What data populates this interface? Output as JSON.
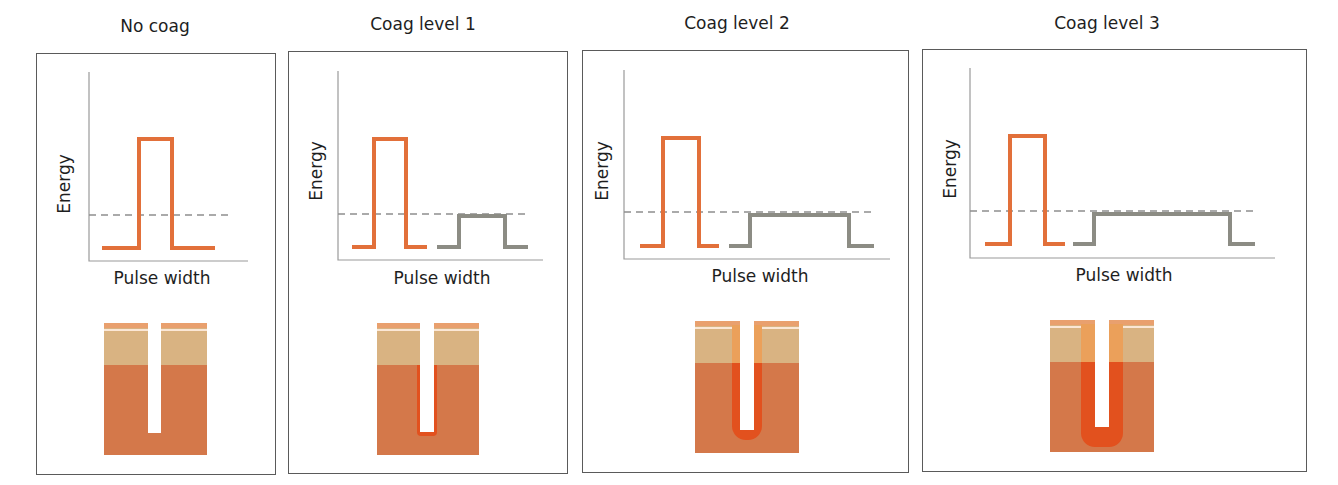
{
  "figure": {
    "panels": [
      {
        "title": "No coag",
        "xlabel": "Pulse width",
        "ylabel": "Energy",
        "box": {
          "x": 36,
          "y": 53,
          "w": 240,
          "h": 422
        },
        "title_pos": {
          "cx": 155,
          "y": 16
        },
        "axes": {
          "x0": 89,
          "y0": 72,
          "x1": 248,
          "ybase": 261
        },
        "threshold_y": 215,
        "threshold_x1": 231,
        "ablative_pulse": {
          "x_start": 102,
          "x_rise": 139,
          "x_fall": 172,
          "x_end": 215,
          "y_top": 139,
          "y_base": 248
        },
        "coag_pulse": null,
        "xlabel_pos": {
          "cx": 162,
          "y": 268
        },
        "ylabel_pos": {
          "cx": 64,
          "cy": 185
        },
        "tissue": {
          "x": 104,
          "y": 325,
          "w": 103,
          "h": 130,
          "channel_x": 148,
          "channel_w": 13,
          "channel_depth": 108,
          "coag_level": 0
        }
      },
      {
        "title": "Coag level 1",
        "xlabel": "Pulse width",
        "ylabel": "Energy",
        "box": {
          "x": 288,
          "y": 51,
          "w": 280,
          "h": 423
        },
        "title_pos": {
          "cx": 423,
          "y": 14
        },
        "axes": {
          "x0": 338,
          "y0": 71,
          "x1": 543,
          "ybase": 260
        },
        "threshold_y": 214,
        "threshold_x1": 530,
        "ablative_pulse": {
          "x_start": 352,
          "x_rise": 374,
          "x_fall": 406,
          "x_end": 427,
          "y_top": 139,
          "y_base": 247
        },
        "coag_pulse": {
          "x_start": 437,
          "x_rise": 459,
          "x_fall": 505,
          "x_end": 528,
          "y_top": 216,
          "y_base": 247
        },
        "xlabel_pos": {
          "cx": 442,
          "y": 268
        },
        "ylabel_pos": {
          "cx": 316,
          "cy": 172
        },
        "tissue": {
          "x": 377,
          "y": 325,
          "w": 102,
          "h": 130,
          "channel_x": 420,
          "channel_w": 14,
          "channel_depth": 107,
          "coag_level": 1
        }
      },
      {
        "title": "Coag level 2",
        "xlabel": "Pulse width",
        "ylabel": "Energy",
        "box": {
          "x": 582,
          "y": 50,
          "w": 327,
          "h": 423
        },
        "title_pos": {
          "cx": 737,
          "y": 13
        },
        "axes": {
          "x0": 624,
          "y0": 70,
          "x1": 890,
          "ybase": 259
        },
        "threshold_y": 212,
        "threshold_x1": 876,
        "ablative_pulse": {
          "x_start": 640,
          "x_rise": 663,
          "x_fall": 699,
          "x_end": 719,
          "y_top": 138,
          "y_base": 246
        },
        "coag_pulse": {
          "x_start": 729,
          "x_rise": 750,
          "x_fall": 849,
          "x_end": 874,
          "y_top": 215,
          "y_base": 246
        },
        "xlabel_pos": {
          "cx": 760,
          "y": 266
        },
        "ylabel_pos": {
          "cx": 602,
          "cy": 172
        },
        "tissue": {
          "x": 695,
          "y": 323,
          "w": 104,
          "h": 130,
          "channel_x": 740,
          "channel_w": 14,
          "channel_depth": 107,
          "coag_level": 2
        }
      },
      {
        "title": "Coag level 3",
        "xlabel": "Pulse width",
        "ylabel": "Energy",
        "box": {
          "x": 922,
          "y": 49,
          "w": 385,
          "h": 423
        },
        "title_pos": {
          "cx": 1107,
          "y": 13
        },
        "axes": {
          "x0": 970,
          "y0": 68,
          "x1": 1275,
          "ybase": 258
        },
        "threshold_y": 211,
        "threshold_x1": 1256,
        "ablative_pulse": {
          "x_start": 985,
          "x_rise": 1010,
          "x_fall": 1045,
          "x_end": 1065,
          "y_top": 136,
          "y_base": 244
        },
        "coag_pulse": {
          "x_start": 1073,
          "x_rise": 1094,
          "x_fall": 1230,
          "x_end": 1255,
          "y_top": 214,
          "y_base": 244
        },
        "xlabel_pos": {
          "cx": 1124,
          "y": 265
        },
        "ylabel_pos": {
          "cx": 950,
          "cy": 170
        },
        "tissue": {
          "x": 1050,
          "y": 322,
          "w": 104,
          "h": 130,
          "channel_x": 1095,
          "channel_w": 14,
          "channel_depth": 105,
          "coag_level": 3
        }
      }
    ],
    "colors": {
      "frame": "#5a5a5a",
      "axis": "#9a9a9a",
      "ablative_pulse": "#E2703A",
      "coag_pulse": "#8C8C84",
      "threshold_dash": "#8E8E8E",
      "epidermis": "#D9B382",
      "epidermis_top": "#E9A06E",
      "dermis": "#D4784A",
      "coag_epidermis": "#EBA05A",
      "coag_dermis": "#E2511E"
    }
  }
}
